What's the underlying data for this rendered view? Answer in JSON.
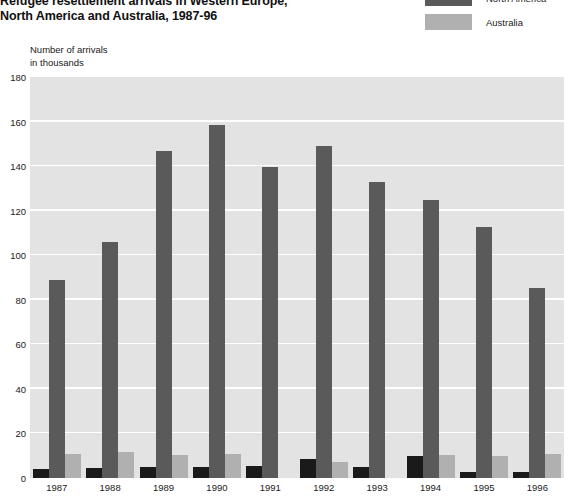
{
  "title": {
    "line1": "Refugee resettlement arrivals in Western Europe,",
    "line2": "North America and Australia, 1987-96"
  },
  "axis_caption": {
    "line1": "Number of arrivals",
    "line2": "in thousands"
  },
  "legend": {
    "items": [
      {
        "label": "North America",
        "color": "#5a5a5a"
      },
      {
        "label": "Australia",
        "color": "#b0b0b0"
      }
    ]
  },
  "colors": {
    "western_europe": "#1a1a1a",
    "north_america": "#5a5a5a",
    "australia": "#b0b0b0",
    "plot_background": "#e3e3e3",
    "gridline": "#ffffff"
  },
  "chart_data": {
    "type": "bar",
    "title": "Refugee resettlement arrivals in Western Europe, North America and Australia, 1987-96",
    "xlabel": "",
    "ylabel": "Number of arrivals in thousands",
    "ylim": [
      0,
      180
    ],
    "yticks": [
      0,
      20,
      40,
      60,
      80,
      100,
      120,
      140,
      160,
      180
    ],
    "grid": true,
    "legend_position": "top-right",
    "categories": [
      "1987",
      "1988",
      "1989",
      "1990",
      "1991",
      "1992",
      "1993",
      "1994",
      "1995",
      "1996"
    ],
    "series": [
      {
        "name": "Western Europe",
        "color": "#1a1a1a",
        "values": [
          4,
          4.5,
          5,
          5,
          5.5,
          8.5,
          5,
          10,
          2.5,
          2.5
        ]
      },
      {
        "name": "North America",
        "color": "#5a5a5a",
        "values": [
          89,
          106,
          147,
          158.5,
          139.5,
          149,
          133,
          125,
          112.5,
          85.5
        ]
      },
      {
        "name": "Australia",
        "color": "#b0b0b0",
        "values": [
          11,
          11.5,
          10.5,
          11,
          0,
          7,
          0,
          10.5,
          10,
          11
        ]
      }
    ]
  }
}
